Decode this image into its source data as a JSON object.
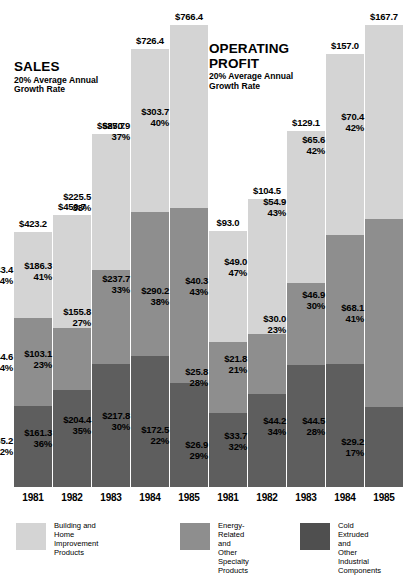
{
  "chart_data": {
    "type": "bar",
    "subtype": "stacked",
    "panels": [
      {
        "id": "sales",
        "title": "SALES",
        "subtitle": "20% Average Annual\nGrowth Rate",
        "categories": [
          "1981",
          "1982",
          "1983",
          "1984",
          "1985"
        ],
        "totals": [
          "$423.2",
          "$450.7",
          "$585.7",
          "$726.4",
          "$766.4"
        ],
        "total_values": [
          423.2,
          450.7,
          585.7,
          726.4,
          766.4
        ],
        "series": [
          {
            "name": "Building and Home Improvement Products",
            "key": "light",
            "values": [
              143.4,
              186.3,
              225.5,
              270.9,
              303.7
            ],
            "labels": [
              "$143.4",
              "$186.3",
              "$225.5",
              "$270.9",
              "$303.7"
            ],
            "percents": [
              "34%",
              "41%",
              "38%",
              "37%",
              "40%"
            ]
          },
          {
            "name": "Energy-Related and Other Specialty Products",
            "key": "mid",
            "values": [
              144.6,
              103.1,
              155.8,
              237.7,
              290.2
            ],
            "labels": [
              "$144.6",
              "$103.1",
              "$155.8",
              "$237.7",
              "$290.2"
            ],
            "percents": [
              "34%",
              "23%",
              "27%",
              "33%",
              "38%"
            ]
          },
          {
            "name": "Cold Extruded and Other Industrial Components",
            "key": "dark",
            "values": [
              135.2,
              161.3,
              204.4,
              217.8,
              172.5
            ],
            "labels": [
              "$135.2",
              "$161.3",
              "$204.4",
              "$217.8",
              "$172.5"
            ],
            "percents": [
              "32%",
              "36%",
              "35%",
              "30%",
              "22%"
            ]
          }
        ],
        "ylim": [
          0,
          766.4
        ]
      },
      {
        "id": "operating-profit",
        "title": "OPERATING\nPROFIT",
        "subtitle": "20% Average Annual\nGrowth Rate",
        "categories": [
          "1981",
          "1982",
          "1983",
          "1984",
          "1985"
        ],
        "totals": [
          "$93.0",
          "$104.5",
          "$129.1",
          "$157.0",
          "$167.7"
        ],
        "total_values": [
          93.0,
          104.5,
          129.1,
          157.0,
          167.7
        ],
        "series": [
          {
            "name": "Building and Home Improvement Products",
            "key": "light",
            "values": [
              40.3,
              49.0,
              54.9,
              65.6,
              70.4
            ],
            "labels": [
              "$40.3",
              "$49.0",
              "$54.9",
              "$65.6",
              "$70.4"
            ],
            "percents": [
              "43%",
              "47%",
              "43%",
              "42%",
              "42%"
            ]
          },
          {
            "name": "Energy-Related and Other Specialty Products",
            "key": "mid",
            "values": [
              25.8,
              21.8,
              30.0,
              46.9,
              68.1
            ],
            "labels": [
              "$25.8",
              "$21.8",
              "$30.0",
              "$46.9",
              "$68.1"
            ],
            "percents": [
              "28%",
              "21%",
              "23%",
              "30%",
              "41%"
            ]
          },
          {
            "name": "Cold Extruded and Other Industrial Components",
            "key": "dark",
            "values": [
              26.9,
              33.7,
              44.2,
              44.5,
              29.2
            ],
            "labels": [
              "$26.9",
              "$33.7",
              "$44.2",
              "$44.5",
              "$29.2"
            ],
            "percents": [
              "29%",
              "32%",
              "34%",
              "28%",
              "17%"
            ]
          }
        ],
        "ylim": [
          0,
          167.7
        ]
      }
    ],
    "legend": {
      "position": "bottom",
      "entries": [
        {
          "key": "light",
          "color": "#d4d4d4",
          "label": "Building and\nHome Improvement\nProducts"
        },
        {
          "key": "mid",
          "color": "#8e8e8e",
          "label": "Energy-Related and\nOther Specialty\nProducts"
        },
        {
          "key": "dark",
          "color": "#4f4f4f",
          "label": "Cold Extruded and\nOther Industrial\nComponents"
        }
      ]
    },
    "colors": {
      "light": "#d4d4d4",
      "mid": "#8e8e8e",
      "dark": "#5e5e5e",
      "legend_dark": "#4f4f4f",
      "background": "#ffffff",
      "text": "#000000"
    },
    "xlabel": "",
    "ylabel": "",
    "grid": false
  }
}
